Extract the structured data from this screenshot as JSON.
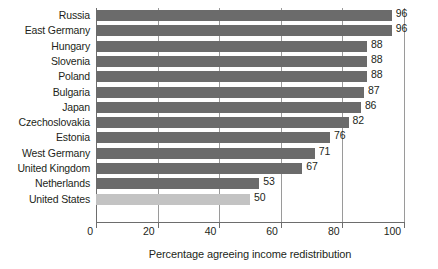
{
  "chart_data": {
    "type": "bar",
    "orientation": "horizontal",
    "title": "",
    "xlabel": "Percentage agreeing income redistribution",
    "ylabel": "",
    "xlim": [
      0,
      100
    ],
    "xticks": [
      0,
      20,
      40,
      60,
      80,
      100
    ],
    "grid": true,
    "legend": false,
    "categories": [
      "Russia",
      "East Germany",
      "Hungary",
      "Slovenia",
      "Poland",
      "Bulgaria",
      "Japan",
      "Czechoslovakia",
      "Estonia",
      "West Germany",
      "United Kingdom",
      "Netherlands",
      "United States"
    ],
    "values": [
      96,
      96,
      88,
      88,
      88,
      87,
      86,
      82,
      76,
      71,
      67,
      53,
      50
    ],
    "highlighted": [
      "United States"
    ],
    "colors": {
      "bar": "#6b6b6b",
      "bar_highlight": "#c3c3c3",
      "axis": "#6d6d6d",
      "gridline": "#9a9a9a",
      "text": "#231f20",
      "background": "#ffffff"
    }
  }
}
